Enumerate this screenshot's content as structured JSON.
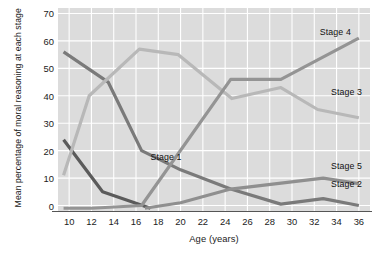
{
  "chart_data": {
    "type": "line",
    "title": "",
    "xlabel": "Age (years)",
    "ylabel": "Mean percentage of moral reasoning at each stage",
    "xlim": [
      9,
      37
    ],
    "ylim": [
      -2,
      72
    ],
    "xticks": [
      10,
      12,
      14,
      16,
      18,
      20,
      22,
      24,
      26,
      28,
      30,
      32,
      34,
      36
    ],
    "yticks": [
      0,
      10,
      20,
      30,
      40,
      50,
      60,
      70
    ],
    "grid": true,
    "legend_position": "inline-labels",
    "series": [
      {
        "name": "Stage 1",
        "color": "#5b5b5b",
        "label_x": 17.3,
        "label_y": 17.5,
        "x": [
          9.5,
          13,
          17.3
        ],
        "values": [
          24,
          5,
          -1
        ]
      },
      {
        "name": "Stage 2",
        "color": "#7a7a7a",
        "label_x": 33.5,
        "label_y": 7.5,
        "x": [
          9.5,
          13.5,
          16.5,
          20,
          24.5,
          29,
          32.8,
          36
        ],
        "values": [
          56,
          45,
          20,
          13,
          6,
          0.5,
          2.5,
          0
        ]
      },
      {
        "name": "Stage 3",
        "color": "#b8b8b8",
        "label_x": 33.5,
        "label_y": 41,
        "x": [
          9.5,
          11.8,
          16.3,
          19.8,
          24.6,
          29,
          32.3,
          36
        ],
        "values": [
          11,
          40,
          57,
          55,
          39,
          43,
          35,
          32
        ]
      },
      {
        "name": "Stage 4",
        "color": "#949494",
        "label_x": 32.5,
        "label_y": 63,
        "x": [
          9.5,
          12,
          16.5,
          24.5,
          29,
          36
        ],
        "values": [
          -1,
          -1,
          0,
          46,
          46,
          61
        ]
      },
      {
        "name": "Stage 5",
        "color": "#8f8f8f",
        "label_x": 33.5,
        "label_y": 14,
        "x": [
          16.8,
          20,
          24.5,
          32.8,
          36
        ],
        "values": [
          -1,
          1,
          6,
          10,
          8
        ]
      }
    ]
  }
}
